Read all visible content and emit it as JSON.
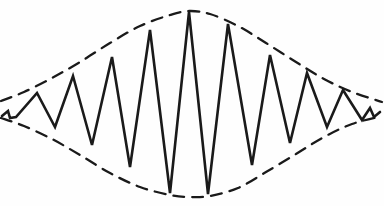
{
  "figure": {
    "description": "Hand-drawn line figure: a high-frequency triangular/zigzag oscillation whose amplitude grows from the left edge to a maximum at the center and decays again toward the right edge. Two dashed curves trace the upper and lower amplitude envelope, forming a lens (wave-packet) shape.",
    "background_color": "#fefefe",
    "ink_color": "#1a1a1a",
    "canvas": {
      "width": 384,
      "height": 206
    },
    "baseline_y": 109,
    "style": {
      "wave_stroke_width": 2.6,
      "envelope_stroke_width": 2.3,
      "envelope_dash_pattern": "11 8",
      "wave_line_join": "miter",
      "hand_drawn": true
    },
    "labels": {
      "x_axis": "",
      "y_axis": "",
      "annotations": []
    }
  },
  "chart_data": {
    "type": "line",
    "xlabel": "",
    "ylabel": "",
    "grid": false,
    "legend_position": "none",
    "xlim": [
      0,
      384
    ],
    "ylim": [
      206,
      0
    ],
    "axis_note": "Pixel coordinates of the original drawing; y increases downward.",
    "series": [
      {
        "name": "oscillation",
        "style": "solid",
        "points": [
          [
            2,
            116
          ],
          [
            8,
            111
          ],
          [
            10,
            118
          ],
          [
            16,
            117
          ],
          [
            37,
            93
          ],
          [
            55,
            127
          ],
          [
            73,
            76
          ],
          [
            92,
            145
          ],
          [
            112,
            57
          ],
          [
            130,
            167
          ],
          [
            150,
            30
          ],
          [
            170,
            193
          ],
          [
            189,
            12
          ],
          [
            208,
            194
          ],
          [
            228,
            24
          ],
          [
            252,
            165
          ],
          [
            270,
            55
          ],
          [
            290,
            143
          ],
          [
            307,
            73
          ],
          [
            327,
            127
          ],
          [
            343,
            90
          ],
          [
            362,
            120
          ],
          [
            370,
            108
          ],
          [
            374,
            117
          ],
          [
            380,
            112
          ]
        ]
      },
      {
        "name": "upper-envelope",
        "style": "dashed",
        "points": [
          [
            1,
            101
          ],
          [
            24,
            92
          ],
          [
            52,
            78
          ],
          [
            80,
            62
          ],
          [
            110,
            43
          ],
          [
            140,
            26
          ],
          [
            170,
            15
          ],
          [
            189,
            11
          ],
          [
            210,
            14
          ],
          [
            238,
            26
          ],
          [
            266,
            43
          ],
          [
            296,
            62
          ],
          [
            324,
            79
          ],
          [
            352,
            92
          ],
          [
            382,
            102
          ]
        ]
      },
      {
        "name": "lower-envelope",
        "style": "dashed",
        "points": [
          [
            1,
            118
          ],
          [
            24,
            126
          ],
          [
            52,
            139
          ],
          [
            80,
            155
          ],
          [
            110,
            173
          ],
          [
            140,
            187
          ],
          [
            170,
            195
          ],
          [
            189,
            197
          ],
          [
            210,
            196
          ],
          [
            238,
            188
          ],
          [
            266,
            172
          ],
          [
            296,
            154
          ],
          [
            324,
            137
          ],
          [
            352,
            124
          ],
          [
            382,
            116
          ]
        ]
      }
    ],
    "peaks": [
      {
        "index": 1,
        "x": 37,
        "y": 93,
        "amplitude": 16
      },
      {
        "index": 2,
        "x": 73,
        "y": 76,
        "amplitude": 33
      },
      {
        "index": 3,
        "x": 112,
        "y": 57,
        "amplitude": 52
      },
      {
        "index": 4,
        "x": 150,
        "y": 30,
        "amplitude": 79
      },
      {
        "index": 5,
        "x": 189,
        "y": 12,
        "amplitude": 97
      },
      {
        "index": 6,
        "x": 228,
        "y": 24,
        "amplitude": 85
      },
      {
        "index": 7,
        "x": 270,
        "y": 55,
        "amplitude": 54
      },
      {
        "index": 8,
        "x": 307,
        "y": 73,
        "amplitude": 36
      },
      {
        "index": 9,
        "x": 343,
        "y": 90,
        "amplitude": 19
      }
    ],
    "troughs": [
      {
        "index": 1,
        "x": 55,
        "y": 127,
        "amplitude": 18
      },
      {
        "index": 2,
        "x": 92,
        "y": 145,
        "amplitude": 36
      },
      {
        "index": 3,
        "x": 130,
        "y": 167,
        "amplitude": 58
      },
      {
        "index": 4,
        "x": 170,
        "y": 193,
        "amplitude": 84
      },
      {
        "index": 5,
        "x": 208,
        "y": 194,
        "amplitude": 85
      },
      {
        "index": 6,
        "x": 252,
        "y": 165,
        "amplitude": 56
      },
      {
        "index": 7,
        "x": 290,
        "y": 143,
        "amplitude": 34
      },
      {
        "index": 8,
        "x": 327,
        "y": 127,
        "amplitude": 18
      },
      {
        "index": 9,
        "x": 362,
        "y": 120,
        "amplitude": 11
      }
    ]
  }
}
